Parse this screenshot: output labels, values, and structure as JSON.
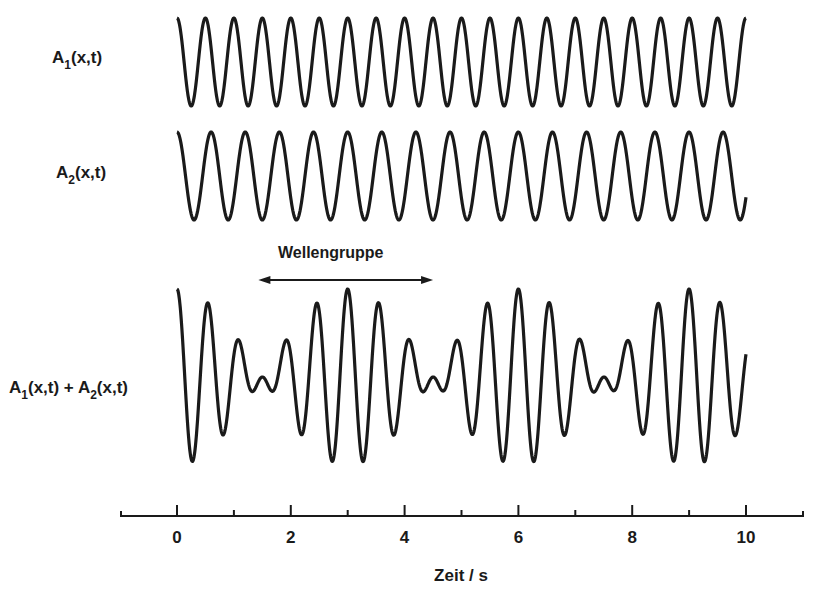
{
  "chart_data": {
    "type": "line",
    "title": "",
    "xlabel": "Zeit / s",
    "ylabel": "",
    "xlim": [
      -1,
      11
    ],
    "x_ticks_major": [
      0,
      2,
      4,
      6,
      8,
      10
    ],
    "x_ticks_minor": [
      1,
      3,
      5,
      7,
      9
    ],
    "grid": false,
    "legend": "none",
    "series": [
      {
        "name": "A1(x,t)",
        "label_base": "A",
        "label_sub": "1",
        "label_rest": "(x,t)",
        "function": "cos(2*pi*2*t)",
        "frequency_hz": 2.0,
        "period_s": 0.5,
        "amplitude": 1,
        "t_range": [
          0,
          10
        ]
      },
      {
        "name": "A2(x,t)",
        "label_base": "A",
        "label_sub": "2",
        "label_rest": "(x,t)",
        "function": "cos(2*pi*(5/3)*t)",
        "frequency_hz": 1.667,
        "period_s": 0.6,
        "amplitude": 1,
        "t_range": [
          0,
          10
        ]
      },
      {
        "name": "A1(x,t) + A2(x,t)",
        "function": "cos(2*pi*2*t)+cos(2*pi*(5/3)*t)",
        "beat_period_s": 3,
        "amplitude": 2,
        "t_range": [
          0,
          10
        ]
      }
    ],
    "annotations": [
      {
        "text": "Wellengruppe",
        "type": "double-arrow",
        "x_from": 1.5,
        "x_to": 4.5
      }
    ]
  },
  "labels": {
    "a1": {
      "base": "A",
      "sub": "1",
      "rest": "(x,t)"
    },
    "a2": {
      "base": "A",
      "sub": "2",
      "rest": "(x,t)"
    },
    "sum": {
      "base1": "A",
      "sub1": "1",
      "mid": "(x,t) + ",
      "base2": "A",
      "sub2": "2",
      "rest": "(x,t)"
    },
    "group": "Wellengruppe",
    "xaxis_title": "Zeit / s",
    "ticks": [
      "0",
      "2",
      "4",
      "6",
      "8",
      "10"
    ]
  }
}
